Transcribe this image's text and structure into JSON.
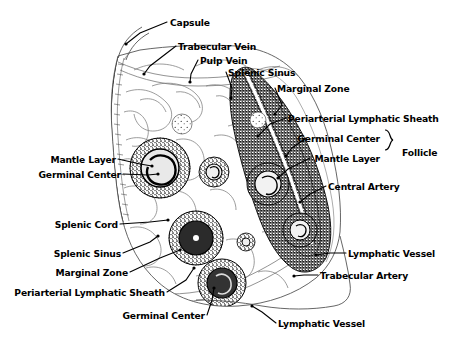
{
  "figure": {
    "ink_color": "#000000",
    "background_color": "#ffffff",
    "width": 454,
    "height": 338
  },
  "group_labels": [
    {
      "text": "Follicle",
      "x": 402,
      "y": 148
    }
  ],
  "labels": [
    {
      "id": "capsule",
      "text": "Capsule",
      "x": 170,
      "y": 18,
      "align": "left"
    },
    {
      "id": "trabecular-vein",
      "text": "Trabecular Vein",
      "x": 178,
      "y": 42,
      "align": "left"
    },
    {
      "id": "pulp-vein",
      "text": "Pulp Vein",
      "x": 200,
      "y": 56,
      "align": "left"
    },
    {
      "id": "splenic-sinus-top",
      "text": "Splenic Sinus",
      "x": 228,
      "y": 68,
      "align": "left"
    },
    {
      "id": "marginal-zone-top",
      "text": "Marginal Zone",
      "x": 277,
      "y": 84,
      "align": "left"
    },
    {
      "id": "pals-right",
      "text": "Periarterial Lymphatic Sheath",
      "x": 288,
      "y": 114,
      "align": "left"
    },
    {
      "id": "germinal-center-r",
      "text": "Germinal Center",
      "x": 380,
      "y": 134,
      "align": "right"
    },
    {
      "id": "mantle-layer-r",
      "text": "Mantle Layer",
      "x": 380,
      "y": 154,
      "align": "right"
    },
    {
      "id": "central-artery",
      "text": "Central Artery",
      "x": 328,
      "y": 182,
      "align": "left"
    },
    {
      "id": "lymphatic-vessel-r",
      "text": "Lymphatic Vessel",
      "x": 348,
      "y": 249,
      "align": "left"
    },
    {
      "id": "trabecular-artery",
      "text": "Trabecular Artery",
      "x": 320,
      "y": 271,
      "align": "left"
    },
    {
      "id": "mantle-layer-l",
      "text": "Mantle Layer",
      "x": 116,
      "y": 155,
      "align": "right"
    },
    {
      "id": "germinal-center-l",
      "text": "Germinal Center",
      "x": 121,
      "y": 170,
      "align": "right"
    },
    {
      "id": "splenic-cord",
      "text": "Splenic Cord",
      "x": 118,
      "y": 220,
      "align": "right"
    },
    {
      "id": "splenic-sinus-bl",
      "text": "Splenic Sinus",
      "x": 121,
      "y": 249,
      "align": "right"
    },
    {
      "id": "marginal-zone-bl",
      "text": "Marginal Zone",
      "x": 128,
      "y": 268,
      "align": "right"
    },
    {
      "id": "pals-bottom-left",
      "text": "Periarterial Lymphatic Sheath",
      "x": 165,
      "y": 288,
      "align": "right"
    },
    {
      "id": "germinal-center-b",
      "text": "Germinal Center",
      "x": 205,
      "y": 311,
      "align": "right"
    },
    {
      "id": "lymphatic-vessel-b",
      "text": "Lymphatic Vessel",
      "x": 278,
      "y": 319,
      "align": "left"
    }
  ],
  "leader_lines": [
    {
      "id": "leader-capsule",
      "points": "167,22 140,33 126,44"
    },
    {
      "id": "leader-trabecular-vein",
      "points": "176,46 150,66 144,74"
    },
    {
      "id": "leader-pulp-vein",
      "points": "198,60 191,74 190,82"
    },
    {
      "id": "leader-splenic-sinus-top",
      "points": "226,72 232,88 231,98"
    },
    {
      "id": "leader-marginal-zone-top",
      "points": "275,88 282,105 275,114"
    },
    {
      "id": "leader-pals-right",
      "points": "286,118 270,124 258,136"
    },
    {
      "id": "leader-germinal-center-r",
      "points": "306,138 292,148 286,156"
    },
    {
      "id": "leader-mantle-layer-r",
      "points": "310,158 288,169 278,178"
    },
    {
      "id": "leader-central-artery",
      "points": "326,186 310,194 300,202"
    },
    {
      "id": "leader-lymphatic-vessel-r",
      "points": "346,253 330,253 316,255"
    },
    {
      "id": "leader-trabecular-artery",
      "points": "318,275 304,275 294,276"
    },
    {
      "id": "leader-mantle-layer-l",
      "points": "118,159 140,164 152,166"
    },
    {
      "id": "leader-germinal-center-l",
      "points": "123,174 148,175 158,174"
    },
    {
      "id": "leader-splenic-cord",
      "points": "120,224 150,222 168,220"
    },
    {
      "id": "leader-splenic-sinus-bl",
      "points": "123,253 150,242 158,236"
    },
    {
      "id": "leader-marginal-zone-bl",
      "points": "130,272 160,258 180,250"
    },
    {
      "id": "leader-pals-bottom-left",
      "points": "167,292 186,280 194,268"
    },
    {
      "id": "leader-germinal-center-b",
      "points": "207,315 212,300 214,288"
    },
    {
      "id": "leader-lymphatic-vessel-b",
      "points": "276,323 262,312 252,306"
    }
  ]
}
